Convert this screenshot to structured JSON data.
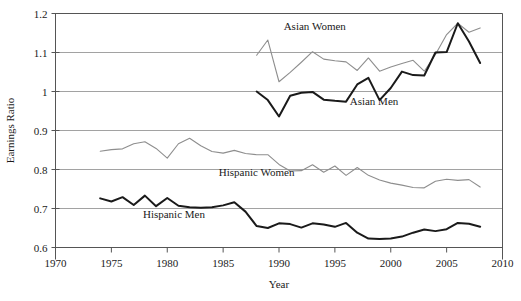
{
  "chart_data": {
    "type": "line",
    "title": "",
    "xlabel": "Year",
    "ylabel": "Earnings Ratio",
    "xlim": [
      1970,
      2010
    ],
    "ylim": [
      0.6,
      1.2
    ],
    "xticks": [
      1970,
      1975,
      1980,
      1985,
      1990,
      1995,
      2000,
      2005,
      2010
    ],
    "xtick_labels": [
      "1970",
      "1975",
      "1980",
      "1985",
      "1990",
      "1995",
      "2000",
      "2005",
      "2010"
    ],
    "yticks": [
      0.6,
      0.7,
      0.8,
      0.9,
      1.0,
      1.1,
      1.2
    ],
    "ytick_labels": [
      "0.6",
      "0.7",
      "0.8",
      "0.9",
      "1",
      "1.1",
      "1.2"
    ],
    "grid": true,
    "grid_axis": "y",
    "legend": "inline-annotations",
    "series": [
      {
        "name": "Asian Women",
        "style": "thin-gray",
        "color": "#8e8e8e",
        "label_x": 1993.2,
        "label_y": 1.158,
        "x": [
          1988,
          1989,
          1990,
          1991,
          1992,
          1993,
          1994,
          1995,
          1996,
          1997,
          1998,
          1999,
          2000,
          2001,
          2002,
          2003,
          2004,
          2005,
          2006,
          2007,
          2008
        ],
        "values": [
          1.093,
          1.132,
          1.025,
          1.049,
          1.075,
          1.102,
          1.083,
          1.079,
          1.076,
          1.054,
          1.086,
          1.052,
          1.063,
          1.072,
          1.08,
          1.052,
          1.095,
          1.146,
          1.175,
          1.152,
          1.163
        ]
      },
      {
        "name": "Asian Men",
        "style": "thick-black",
        "color": "#1a1a1a",
        "label_x": 1998.5,
        "label_y": 0.966,
        "x": [
          1988,
          1989,
          1990,
          1991,
          1992,
          1993,
          1994,
          1995,
          1996,
          1997,
          1998,
          1999,
          2000,
          2001,
          2002,
          2003,
          2004,
          2005,
          2006,
          2007,
          2008
        ],
        "values": [
          1.0,
          0.978,
          0.936,
          0.989,
          0.997,
          0.999,
          0.979,
          0.976,
          0.974,
          1.018,
          1.035,
          0.978,
          1.009,
          1.051,
          1.042,
          1.041,
          1.1,
          1.101,
          1.175,
          1.128,
          1.073
        ]
      },
      {
        "name": "Hispanic Women",
        "style": "thin-gray",
        "color": "#8e8e8e",
        "label_x": 1988.0,
        "label_y": 0.783,
        "x": [
          1974,
          1975,
          1976,
          1977,
          1978,
          1979,
          1980,
          1981,
          1982,
          1983,
          1984,
          1985,
          1986,
          1987,
          1988,
          1989,
          1990,
          1991,
          1992,
          1993,
          1994,
          1995,
          1996,
          1997,
          1998,
          1999,
          2000,
          2001,
          2002,
          2003,
          2004,
          2005,
          2006,
          2007,
          2008
        ],
        "values": [
          0.847,
          0.851,
          0.853,
          0.866,
          0.871,
          0.854,
          0.829,
          0.866,
          0.88,
          0.861,
          0.846,
          0.842,
          0.849,
          0.841,
          0.838,
          0.838,
          0.813,
          0.796,
          0.797,
          0.812,
          0.793,
          0.809,
          0.785,
          0.805,
          0.785,
          0.773,
          0.765,
          0.76,
          0.754,
          0.753,
          0.77,
          0.775,
          0.772,
          0.774,
          0.755
        ]
      },
      {
        "name": "Hispanic Men",
        "style": "thick-black",
        "color": "#1a1a1a",
        "label_x": 1980.6,
        "label_y": 0.676,
        "x": [
          1974,
          1975,
          1976,
          1977,
          1978,
          1979,
          1980,
          1981,
          1982,
          1983,
          1984,
          1985,
          1986,
          1987,
          1988,
          1989,
          1990,
          1991,
          1992,
          1993,
          1994,
          1995,
          1996,
          1997,
          1998,
          1999,
          2000,
          2001,
          2002,
          2003,
          2004,
          2005,
          2006,
          2007,
          2008
        ],
        "values": [
          0.726,
          0.718,
          0.729,
          0.709,
          0.733,
          0.706,
          0.727,
          0.707,
          0.703,
          0.702,
          0.703,
          0.708,
          0.716,
          0.692,
          0.655,
          0.65,
          0.662,
          0.66,
          0.651,
          0.662,
          0.659,
          0.653,
          0.663,
          0.638,
          0.623,
          0.622,
          0.623,
          0.628,
          0.638,
          0.646,
          0.642,
          0.647,
          0.663,
          0.661,
          0.653
        ]
      }
    ]
  }
}
